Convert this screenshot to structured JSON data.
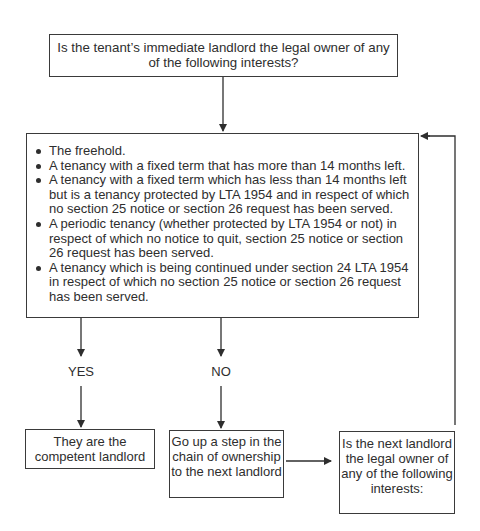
{
  "diagram": {
    "top_question": "Is the tenant’s immediate landlord the legal owner of any of the following interests?",
    "interests": [
      "The freehold.",
      "A tenancy with a fixed term that has more than 14 months left.",
      "A tenancy with a fixed term which has less than 14 months left but is a tenancy protected by LTA 1954 and in respect of which no section 25 notice or section 26 request has been served.",
      "A periodic tenancy (whether protected by LTA 1954 or not) in respect of which no notice to quit, section 25 notice or section 26 request has been served.",
      "A tenancy which is being continued under section 24 LTA 1954 in respect of which no section 25 notice or section 26 request has been served."
    ],
    "yes_label": "YES",
    "no_label": "NO",
    "yes_outcome": "They are the competent landlord",
    "no_outcome": "Go up a step in the chain of ownership to the next landlord",
    "next_question": "Is the next landlord the legal owner of any of the following interests:"
  },
  "colors": {
    "line": "#2e2e2e",
    "text": "#2e2e2e",
    "background": "#ffffff"
  }
}
